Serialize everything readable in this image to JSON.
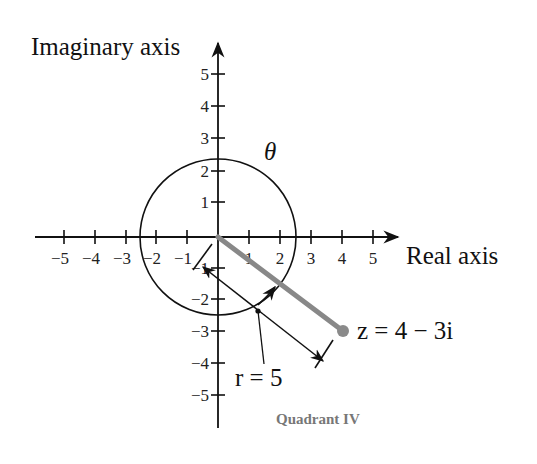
{
  "diagram": {
    "type": "complex-plane-polar-form",
    "axes": {
      "x_title": "Real axis",
      "y_title": "Imaginary axis",
      "x_ticks": [
        "−5",
        "−4",
        "−3",
        "−2",
        "−1",
        "1",
        "2",
        "3",
        "4",
        "5"
      ],
      "y_ticks": [
        "5",
        "4",
        "3",
        "2",
        "1",
        "−1",
        "−2",
        "−3",
        "−4",
        "−5"
      ]
    },
    "point": {
      "label": "z = 4 − 3i",
      "re": 4,
      "im": -3,
      "color": "#8a8a8a"
    },
    "angle_label": "θ",
    "modulus_label": "r = 5",
    "quadrant_label": "Quadrant IV",
    "colors": {
      "axis": "#111111",
      "vector": "#888888",
      "quadrant_text": "#777777"
    }
  }
}
